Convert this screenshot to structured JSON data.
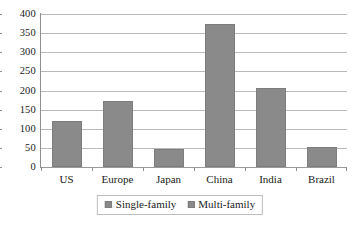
{
  "chart_data": {
    "type": "bar",
    "title": "",
    "subtitle": "",
    "xlabel": "",
    "ylabel": "",
    "categories": [
      "US",
      "Europe",
      "Japan",
      "China",
      "India",
      "Brazil"
    ],
    "series": [
      {
        "name": "Single-family",
        "values": [
          120,
          172,
          48,
          375,
          207,
          52
        ]
      },
      {
        "name": "Multi-family",
        "values": [
          null,
          null,
          null,
          null,
          null,
          null
        ]
      }
    ],
    "values": [
      120,
      172,
      48,
      375,
      207,
      52
    ],
    "ylim": [
      0,
      400
    ],
    "yticks": [
      0,
      50,
      100,
      150,
      200,
      250,
      300,
      350,
      400
    ],
    "ytick_labels": [
      "0",
      "50",
      "100",
      "150",
      "200",
      "250",
      "300",
      "350",
      "400"
    ],
    "grid": true,
    "grid_axis": "y",
    "legend_position": "bottom",
    "legend_entries": [
      "Single-family",
      "Multi-family"
    ],
    "bar_color": "#8a8a8a",
    "grid_color": "#b9b9b9",
    "axis_color": "#8f8f8f"
  }
}
